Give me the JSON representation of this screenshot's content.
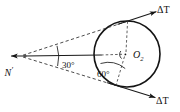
{
  "figure": {
    "background_color": "#ffffff",
    "line_color": "#1a1a1a",
    "width": 180,
    "height": 112
  },
  "labels": {
    "apex_point": "N",
    "apex_prime": "′",
    "center_point": "O",
    "center_subscript": "2",
    "apex_angle": "30°",
    "center_angle": "60°",
    "force_upper": "ΔT",
    "force_lower": "ΔT"
  },
  "geometry": {
    "apex": {
      "x": 20,
      "y": 56
    },
    "center": {
      "x": 127,
      "y": 54
    },
    "radius": 33,
    "tangent_point_upper": {
      "x": 127.6,
      "y": 21.2
    },
    "tangent_point_lower": {
      "x": 116.0,
      "y": 85.5
    },
    "apex_half_angle_deg": 15,
    "apex_full_angle_deg": 30,
    "center_marked_angle_deg": 60
  },
  "elements": {
    "circle_name": "pulley-circle",
    "upper_tangent_name": "upper-tangent-line",
    "lower_tangent_name": "lower-tangent-line",
    "axis_name": "center-axis-line"
  }
}
